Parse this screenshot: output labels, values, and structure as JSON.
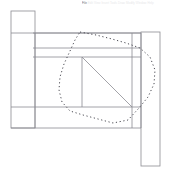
{
  "app": {
    "title": "CAD Drawing Viewport",
    "background_color": "#ffffff"
  },
  "toolbar": {
    "items": [
      {
        "label": "File",
        "active": true
      },
      {
        "label": "Edit",
        "active": false
      },
      {
        "label": "View",
        "active": false
      },
      {
        "label": "Insert",
        "active": false
      },
      {
        "label": "Tools",
        "active": false
      },
      {
        "label": "Draw",
        "active": false
      },
      {
        "label": "Modify",
        "active": false
      },
      {
        "label": "Window",
        "active": false
      },
      {
        "label": "Help",
        "active": false
      }
    ]
  },
  "drawing": {
    "type": "structural-elevation",
    "stroke_color": "#8c8c92",
    "stroke_width": 0.8,
    "selection_color": "#4a4a52",
    "selection_dash": "1.2 2.6",
    "shapes": [
      {
        "name": "left-column",
        "kind": "rect",
        "x": 11,
        "y": 11,
        "width": 24,
        "height": 117
      },
      {
        "name": "right-column",
        "kind": "rect",
        "x": 141,
        "y": 32,
        "width": 19,
        "height": 134
      },
      {
        "name": "main-body-outline",
        "kind": "polyline",
        "points": "11,33 141,33 141,128 11,128"
      },
      {
        "name": "top-beam-flange-line",
        "kind": "line",
        "x1": 33,
        "y1": 33,
        "x2": 141,
        "y2": 33
      },
      {
        "name": "mid-beam-flange-line",
        "kind": "line",
        "x1": 33,
        "y1": 48,
        "x2": 141,
        "y2": 48
      },
      {
        "name": "lower-beam-flange-line",
        "kind": "line",
        "x1": 33,
        "y1": 57,
        "x2": 141,
        "y2": 57
      },
      {
        "name": "bottom-chord-line",
        "kind": "line",
        "x1": 11,
        "y1": 107,
        "x2": 141,
        "y2": 107
      },
      {
        "name": "vertical-web-stiffener-left",
        "kind": "line",
        "x1": 35,
        "y1": 33,
        "x2": 35,
        "y2": 128
      },
      {
        "name": "vertical-web-stiffener-mid",
        "kind": "line",
        "x1": 82,
        "y1": 57,
        "x2": 82,
        "y2": 107
      },
      {
        "name": "vertical-web-stiffener-right",
        "kind": "line",
        "x1": 132,
        "y1": 33,
        "x2": 132,
        "y2": 128
      },
      {
        "name": "diagonal-brace",
        "kind": "line",
        "x1": 82,
        "y1": 57,
        "x2": 132,
        "y2": 107
      }
    ],
    "selection_lasso": {
      "name": "lasso-selection-path",
      "points": "80,32 96,35 112,39 126,43 140,48 150,57 155,70 154,84 148,97 139,108 128,120 113,123 98,119 83,115 70,111 62,102 59,90 60,77 64,64 70,51 75,40 80,32"
    }
  }
}
